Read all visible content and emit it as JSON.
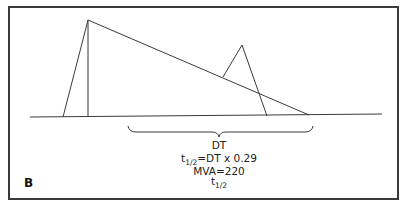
{
  "figure": {
    "panel_label": "B",
    "annotations": {
      "dt": "DT",
      "half_time_formula_prefix": "t",
      "half_time_formula_sub": "1/2",
      "half_time_formula_rest": "=DT x 0.29",
      "mva_formula": "MVA=220",
      "mva_denominator_t": "t",
      "mva_denominator_sub": "1/2"
    },
    "colors": {
      "line": "#3a3a3a",
      "border": "#3a3a3a",
      "background": "#ffffff"
    },
    "shapes": {
      "baseline": {
        "x1": 30,
        "y1": 117,
        "x2": 382,
        "y2": 114
      },
      "e_wave": {
        "points": "63,117 88,20 88,117"
      },
      "deceleration_slope": {
        "x1": 88,
        "y1": 20,
        "x2": 309,
        "y2": 115
      },
      "a_wave": {
        "points": "223,77 242,45 267,116"
      },
      "brace": {
        "x_start": 128,
        "x_end": 313,
        "y_top": 126,
        "y_mid": 132,
        "tip_x": 219,
        "tip_y": 137
      }
    }
  }
}
